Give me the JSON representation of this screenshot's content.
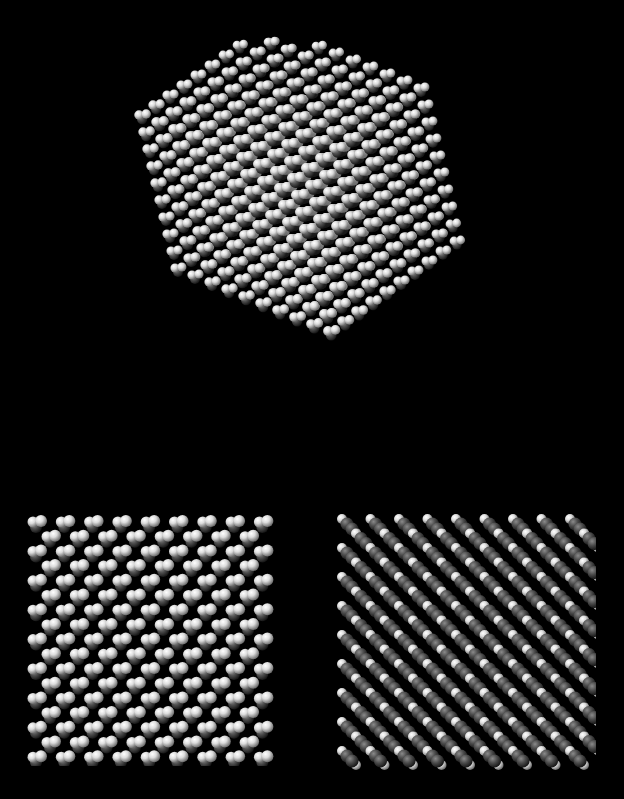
{
  "figure": {
    "background": "#000000",
    "width": 624,
    "height": 799,
    "atom_colors": {
      "hydrogen_light": "#e8e8e8",
      "hydrogen_mid": "#bdbdbd",
      "carbon_dark": "#3a3a3a",
      "carbon_mid": "#5a5a5a"
    }
  },
  "panels": [
    {
      "id": "perspective-cluster",
      "description": "3D perspective view of molecular crystal cluster",
      "x": 100,
      "y": 35,
      "width": 420,
      "height": 425
    },
    {
      "id": "lattice-view-a",
      "description": "Orthographic lattice projection, light-dominant (H atoms front)",
      "x": 25,
      "y": 512,
      "width": 255,
      "height": 250,
      "cols": 9,
      "rows": 9,
      "spacing_x": 28.3,
      "spacing_y": 29.3,
      "offset_rows": true
    },
    {
      "id": "lattice-view-b",
      "description": "Orthographic lattice projection, dark-dominant diagonal molecules (C atoms front)",
      "x": 333,
      "y": 512,
      "width": 260,
      "height": 255,
      "cols": 9,
      "rows": 9,
      "spacing_x": 28.5,
      "spacing_y": 29.0,
      "offset_rows": true
    }
  ]
}
